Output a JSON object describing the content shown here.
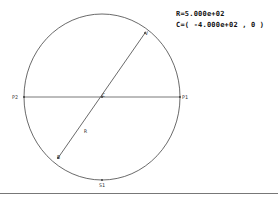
{
  "info": {
    "radius_text": "R=5.000e+02",
    "center_text": "C=( -4.000e+02 , 0 )"
  },
  "diagram": {
    "circle": {
      "cx": 102,
      "cy": 97,
      "rx": 78,
      "ry": 83,
      "stroke": "#444444"
    },
    "horizontal_diameter": {
      "x1": 24,
      "y1": 97,
      "x2": 180,
      "y2": 97
    },
    "radius_line": {
      "x1": 145,
      "y1": 33,
      "x2": 58,
      "y2": 158
    },
    "bottom_rule": {
      "x1": 0,
      "y1": 193.5,
      "x2": 278,
      "y2": 193.5,
      "stroke": "#777777"
    },
    "points": [
      {
        "label": "P2",
        "x": 24,
        "y": 97
      },
      {
        "label": "P1",
        "x": 180,
        "y": 97
      },
      {
        "label": "C",
        "x": 102,
        "y": 97
      },
      {
        "label": "V",
        "x": 145,
        "y": 33
      },
      {
        "label": "B",
        "x": 58,
        "y": 158
      },
      {
        "label": "R",
        "x": 85,
        "y": 131
      },
      {
        "label": "S1",
        "x": 102,
        "y": 180
      }
    ]
  }
}
